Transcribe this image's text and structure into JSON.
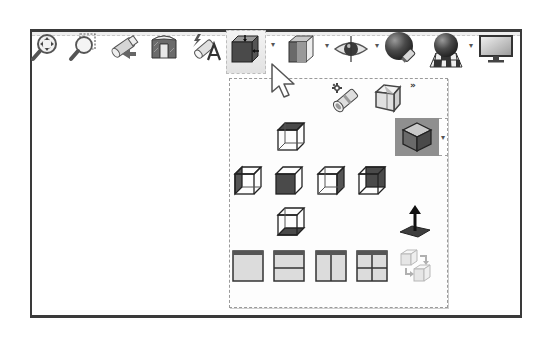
{
  "toolbar": {
    "items": [
      {
        "name": "zoom-to-fit",
        "icon": "zoom-to-fit-icon"
      },
      {
        "name": "zoom-to-area",
        "icon": "zoom-to-area-icon"
      },
      {
        "name": "previous-view",
        "icon": "previous-view-icon"
      },
      {
        "name": "section-view",
        "icon": "section-view-icon"
      },
      {
        "name": "dynamic-annotation-views",
        "icon": "dynamic-annotation-icon"
      },
      {
        "name": "view-orientation",
        "icon": "view-orientation-icon",
        "active": true,
        "has_dropdown": true
      },
      {
        "name": "display-style",
        "icon": "display-style-icon",
        "has_dropdown": true
      },
      {
        "name": "hide-show-items",
        "icon": "eye-icon",
        "has_dropdown": true
      },
      {
        "name": "edit-appearance",
        "icon": "appearance-sphere-icon"
      },
      {
        "name": "apply-scene",
        "icon": "scene-icon",
        "has_dropdown": true
      },
      {
        "name": "view-settings",
        "icon": "monitor-icon"
      }
    ],
    "dropdown_glyph": "▾"
  },
  "flyout": {
    "more_glyph": "»",
    "row1": [
      {
        "name": "camera-view",
        "icon": "camera-icon"
      },
      {
        "name": "3d-drawing-view",
        "icon": "3d-view-cube-icon"
      }
    ],
    "standard_views": [
      {
        "name": "top",
        "icon": "top-view-icon"
      },
      {
        "name": "left",
        "icon": "left-view-icon"
      },
      {
        "name": "front",
        "icon": "front-view-icon"
      },
      {
        "name": "right",
        "icon": "right-view-icon"
      },
      {
        "name": "back",
        "icon": "back-view-icon"
      },
      {
        "name": "bottom",
        "icon": "bottom-view-icon"
      }
    ],
    "isometric": {
      "name": "isometric",
      "icon": "isometric-view-icon",
      "selected": true,
      "has_dropdown": true
    },
    "normal_to": {
      "name": "normal-to",
      "icon": "normal-to-icon"
    },
    "viewports": [
      {
        "name": "single-view",
        "icon": "single-viewport-icon"
      },
      {
        "name": "two-view-horizontal",
        "icon": "two-view-horizontal-icon"
      },
      {
        "name": "two-view-vertical",
        "icon": "two-view-vertical-icon"
      },
      {
        "name": "four-view",
        "icon": "four-view-icon"
      },
      {
        "name": "link-views",
        "icon": "link-views-icon",
        "disabled": true
      }
    ]
  },
  "colors": {
    "frame": "#3a3a3a",
    "icon_dark": "#3c3c3c",
    "icon_mid": "#7a7a7a",
    "icon_light": "#d8d8d8",
    "selected_bg": "#8f8f8f"
  }
}
